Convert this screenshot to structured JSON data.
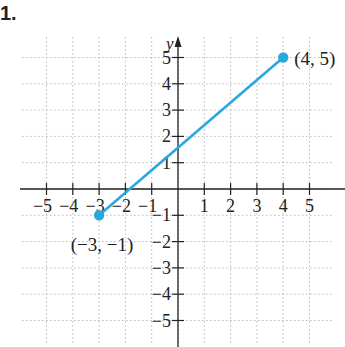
{
  "problem": {
    "label": "1."
  },
  "chart_data": {
    "type": "line",
    "title": "",
    "xlabel": "",
    "ylabel": "y",
    "xlim": [
      -6,
      6
    ],
    "ylim": [
      -6,
      6
    ],
    "grid": true,
    "x_ticks": [
      -5,
      -4,
      -3,
      -2,
      -1,
      1,
      2,
      3,
      4,
      5
    ],
    "y_ticks": [
      -5,
      -4,
      -3,
      -2,
      -1,
      1,
      2,
      3,
      4,
      5
    ],
    "x_tick_labels": [
      "−5",
      "−4",
      "−3",
      "−2",
      "−1",
      "1",
      "2",
      "3",
      "4",
      "5"
    ],
    "y_tick_labels": [
      "−5",
      "−4",
      "−3",
      "−2",
      "−1",
      "1",
      "2",
      "3",
      "4",
      "5"
    ],
    "series": [
      {
        "name": "segment",
        "color": "#29a8e0",
        "points": [
          {
            "x": -3,
            "y": -1
          },
          {
            "x": 4,
            "y": 5
          }
        ]
      }
    ],
    "annotations": [
      {
        "text": "(4, 5)",
        "x": 4,
        "y": 5
      },
      {
        "text": "(−3, −1)",
        "x": -3,
        "y": -1
      }
    ]
  },
  "colors": {
    "axis": "#222222",
    "grid": "#b8b8b8",
    "segment": "#29a8e0",
    "text": "#222222"
  }
}
